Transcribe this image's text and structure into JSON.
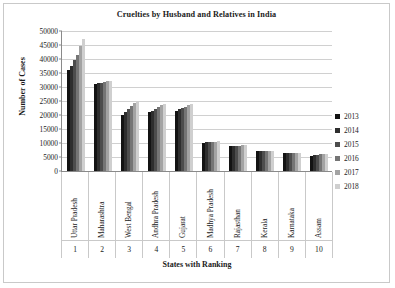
{
  "chart_data": {
    "type": "bar",
    "title": "Cruelties by Husband and Relatives in India",
    "xlabel": "States with Ranking",
    "ylabel": "Number of Cases",
    "ylim": [
      0,
      50000
    ],
    "ytick_labels": [
      "50000",
      "45000",
      "40000",
      "35000",
      "30000",
      "25000",
      "20000",
      "15000",
      "10000",
      "5000",
      "0"
    ],
    "ytick_values": [
      50000,
      45000,
      40000,
      35000,
      30000,
      25000,
      20000,
      15000,
      10000,
      5000,
      0
    ],
    "grid": true,
    "legend_position": "right",
    "categories": [
      "Uttar Pradesh",
      "Maharashtra",
      "West Bengal",
      "Andhra Pradesh",
      "Gujarat",
      "Madhya Pradesh",
      "Rajasthan",
      "Kerala",
      "Karnataka",
      "Assam"
    ],
    "rankings": [
      "1",
      "2",
      "3",
      "4",
      "5",
      "6",
      "7",
      "8",
      "9",
      "10"
    ],
    "series": [
      {
        "name": "2013",
        "color": "#131313",
        "values": [
          36000,
          31000,
          20000,
          21000,
          21500,
          10000,
          9000,
          7000,
          6500,
          5500
        ]
      },
      {
        "name": "2014",
        "color": "#2e2e2e",
        "values": [
          37500,
          31300,
          21000,
          21500,
          22000,
          10200,
          9000,
          7000,
          6500,
          5700
        ]
      },
      {
        "name": "2015",
        "color": "#4d4d4d",
        "values": [
          39500,
          31500,
          22000,
          22300,
          22500,
          10300,
          9100,
          7000,
          6500,
          5800
        ]
      },
      {
        "name": "2016",
        "color": "#757575",
        "values": [
          41500,
          31800,
          23200,
          23000,
          23000,
          10400,
          9100,
          7000,
          6500,
          5900
        ]
      },
      {
        "name": "2017",
        "color": "#a3a3a3",
        "values": [
          44500,
          32000,
          24200,
          23500,
          23500,
          10500,
          9200,
          7000,
          6600,
          6000
        ]
      },
      {
        "name": "2018",
        "color": "#cfcfcf",
        "values": [
          47000,
          32200,
          25000,
          24000,
          24000,
          10600,
          9200,
          7000,
          6600,
          6100
        ]
      }
    ]
  }
}
